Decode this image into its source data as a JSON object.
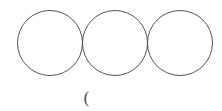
{
  "diagram": {
    "stroke_color": "#555555",
    "circles": [
      {
        "cx": 50,
        "cy": 43,
        "r": 32.5
      },
      {
        "cx": 115,
        "cy": 43,
        "r": 32.5
      },
      {
        "cx": 180,
        "cy": 43,
        "r": 32.5
      }
    ],
    "label": "("
  }
}
